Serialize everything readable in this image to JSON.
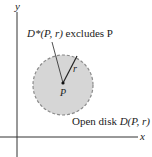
{
  "diagram": {
    "axes": {
      "x_label": "x",
      "y_label": "y"
    },
    "point_label": "P",
    "radius_label": "r",
    "punctured_disk_label": {
      "prefix": "D*(P, r)",
      "suffix": " excludes P"
    },
    "open_disk_label": {
      "prefix": "Open disk ",
      "math": "D(P, r)"
    },
    "colors": {
      "disk_fill": "#d6d6d6",
      "disk_stroke": "#8a8a8a",
      "axis": "#333333",
      "line": "#222222"
    }
  }
}
